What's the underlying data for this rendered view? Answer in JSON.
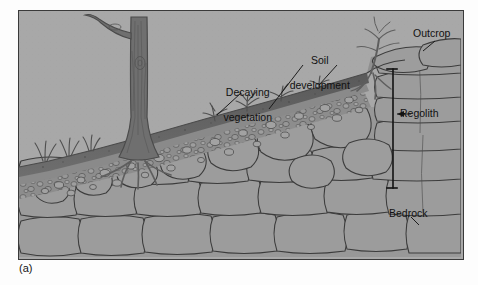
{
  "figure": {
    "caption": "(a)",
    "type": "geological cross-section diagram"
  },
  "colors": {
    "sky": "#a8a8a8",
    "topsoil": "#5d5d5d",
    "subsoil": "#8f8f8f",
    "rock_fill": "#9b9b9b",
    "rock_outline": "#3c3c3c",
    "tree": "#6b6b6b",
    "label_text": "#111111",
    "frame_border": "#3a3a3a"
  },
  "labels": [
    {
      "id": "decaying-vegetation",
      "text": "Decaying\nvegetation",
      "line1": "Decaying",
      "line2": "vegetation",
      "x": 218,
      "y": 70
    },
    {
      "id": "soil-development",
      "text": "Soil\ndevelopment",
      "line1": "Soil",
      "line2": "development",
      "x": 300,
      "y": 40
    },
    {
      "id": "outcrop",
      "text": "Outcrop",
      "x": 437,
      "y": 33
    },
    {
      "id": "regolith",
      "text": "Regolith",
      "x": 425,
      "y": 113
    },
    {
      "id": "bedrock",
      "text": "Bedrock",
      "x": 414,
      "y": 219
    }
  ],
  "annotations": {
    "regolith_bracket": {
      "x": 374,
      "top": 58,
      "bottom": 177
    },
    "leader_lines": [
      {
        "from": "decaying-vegetation",
        "to_x": 245,
        "to_y": 104
      },
      {
        "from": "soil-development",
        "to_x": 268,
        "to_y": 100
      },
      {
        "from": "soil-development",
        "to_x": 317,
        "to_y": 83
      },
      {
        "from": "regolith",
        "to_x": 376,
        "to_y": 113
      }
    ]
  },
  "features": [
    {
      "name": "tree",
      "description": "large deciduous tree trunk with branch, rooted in regolith"
    },
    {
      "name": "shrub",
      "description": "small sapling with roots wedging into outcrop rock"
    },
    {
      "name": "grass-tufts",
      "description": "grass and small plants on soil surface"
    },
    {
      "name": "topsoil-layer",
      "description": "dark organic soil band along slope surface"
    },
    {
      "name": "pebble-zone",
      "description": "small weathered rock fragments below soil"
    },
    {
      "name": "boulder-zone",
      "description": "large rounded partly weathered blocks"
    },
    {
      "name": "bedrock-mass",
      "description": "jointed unweathered bedrock blocks at depth"
    },
    {
      "name": "outcrop-cliff",
      "description": "exposed bedrock outcrop at right side of slope"
    }
  ]
}
